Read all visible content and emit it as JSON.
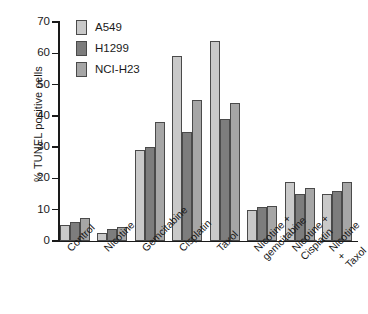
{
  "chart_data": {
    "type": "bar",
    "title": "",
    "xlabel": "",
    "ylabel": "% TUNEL positive cells",
    "ylim": [
      0,
      70
    ],
    "yticks": [
      0,
      10,
      20,
      30,
      40,
      50,
      60,
      70
    ],
    "grid": false,
    "legend_position": "top-left",
    "categories": [
      "Control",
      "Nicotine",
      "Gemcitabine",
      "Cisplatin",
      "Taxol",
      "Nicotine +\ngemcitabine",
      "Nicotine +\nCisplatin",
      "Nicotine +\nTaxol"
    ],
    "series": [
      {
        "name": "A549",
        "color": "#c9c9c9",
        "values": [
          5,
          2.5,
          29,
          59,
          64,
          10,
          19,
          15
        ]
      },
      {
        "name": "H1299",
        "color": "#7d7d7d",
        "values": [
          6,
          4,
          30,
          35,
          39,
          11,
          15,
          16
        ]
      },
      {
        "name": "NCI-H23",
        "color": "#a6a6a6",
        "values": [
          7.2,
          4.5,
          38,
          45,
          44,
          11.2,
          17,
          19
        ]
      }
    ]
  }
}
